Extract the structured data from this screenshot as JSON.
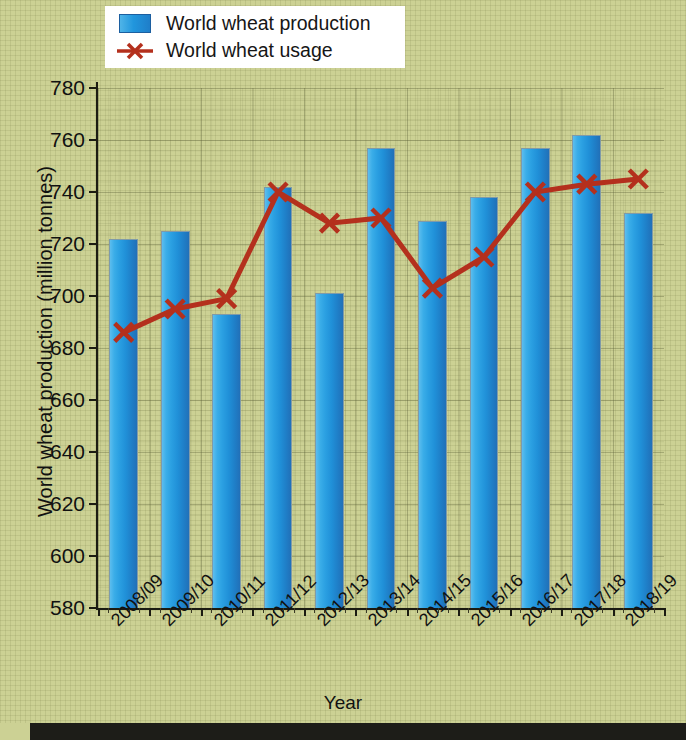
{
  "legend": {
    "position": "top-left",
    "items": [
      {
        "label": "World wheat production",
        "type": "bar",
        "color": "#2196dd",
        "icon": "bar-swatch"
      },
      {
        "label": "World wheat usage",
        "type": "line",
        "color": "#b4301d",
        "icon": "line-x-marker"
      }
    ]
  },
  "colors": {
    "background": "#ccd194",
    "bar_light": "#4fb4e8",
    "bar_dark": "#1f7ec9",
    "line": "#b4301d",
    "axis": "#1b1b12",
    "text": "#111111",
    "legend_background": "#ffffff",
    "bottom_band": "#1d1d18"
  },
  "chart_data": {
    "type": "bar",
    "title": "",
    "xlabel": "Year",
    "ylabel": "World wheat production (million tonnes)",
    "ylim": [
      580,
      780
    ],
    "yticks": [
      580,
      600,
      620,
      640,
      660,
      680,
      700,
      720,
      740,
      760,
      780
    ],
    "grid": true,
    "categories": [
      "2008/09",
      "2009/10",
      "2010/11",
      "2011/12",
      "2012/13",
      "2013/14",
      "2014/15",
      "2015/16",
      "2016/17",
      "2017/18",
      "2018/19"
    ],
    "series": [
      {
        "name": "World wheat production",
        "type": "bar",
        "color": "#2196dd",
        "values": [
          722,
          725,
          693,
          742,
          701,
          757,
          729,
          738,
          757,
          762,
          732
        ]
      },
      {
        "name": "World wheat usage",
        "type": "line",
        "color": "#b4301d",
        "marker": "x",
        "values": [
          686,
          695,
          699,
          740,
          728,
          730,
          703,
          715,
          740,
          743,
          745
        ]
      }
    ]
  }
}
